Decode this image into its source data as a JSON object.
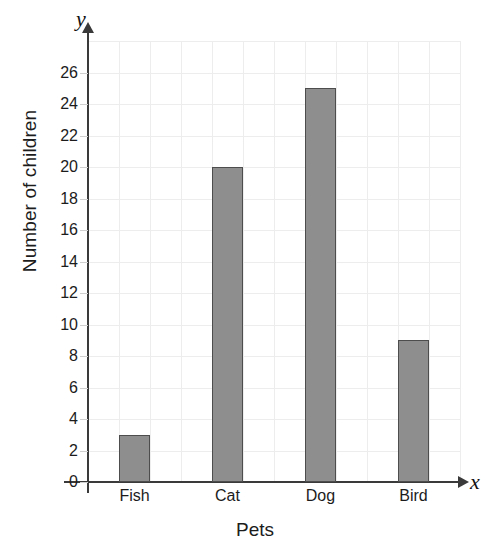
{
  "chart_data": {
    "type": "bar",
    "title": "",
    "categories": [
      "Fish",
      "Cat",
      "Dog",
      "Bird"
    ],
    "values": [
      3,
      20,
      25,
      9
    ],
    "xlabel": "Pets",
    "ylabel": "Number of children",
    "ylim": [
      0,
      28
    ],
    "ytick_labels": [
      "0",
      "2",
      "4",
      "6",
      "8",
      "10",
      "12",
      "14",
      "16",
      "18",
      "20",
      "22",
      "24",
      "26"
    ],
    "ytick_values": [
      0,
      2,
      4,
      6,
      8,
      10,
      12,
      14,
      16,
      18,
      20,
      22,
      24,
      26
    ],
    "grid": true,
    "legend": "none",
    "axis_letters": {
      "y": "y",
      "x": "x"
    },
    "colors": {
      "bar_fill": "#8e8e8e",
      "bar_border": "#4d4d4d",
      "gridline": "#ededed",
      "axis": "#3a3a3a",
      "text": "#1c1c1c",
      "background": "#ffffff"
    }
  }
}
